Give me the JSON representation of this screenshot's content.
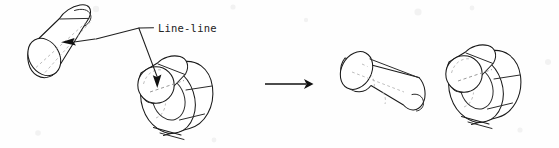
{
  "figure": {
    "kind": "assembly-constraint-diagram",
    "title": "Line-line",
    "background_color": "#fefefe",
    "ink_color": "#1a1a1a",
    "hidden_line_color": "#8f8f8f",
    "width": 559,
    "height": 148
  },
  "annotation": {
    "label": "Line-line",
    "label_x": 158,
    "label_y": 32,
    "leader_vertex_x": 139,
    "leader_vertex_y": 28,
    "leader_dash_end_x": 152,
    "targets": [
      {
        "name": "cylinder-axis",
        "arrow_tip_x": 62,
        "arrow_tip_y": 42,
        "direction": "left"
      },
      {
        "name": "hub-bore-axis",
        "arrow_tip_x": 157,
        "arrow_tip_y": 87,
        "direction": "down"
      }
    ]
  },
  "transform_arrow": {
    "name": "result-arrow",
    "x_start": 265,
    "x_end": 312,
    "y": 84,
    "direction": "right"
  },
  "parts": {
    "left_group": {
      "caption_absent": true,
      "cylinder": {
        "name": "peg-cylinder-before",
        "axis_label": "dashed centerline",
        "end_ellipse_center_x": 44,
        "end_ellipse_center_y": 57
      },
      "hub": {
        "name": "stepped-hub-before",
        "boss_center_x": 156,
        "boss_center_y": 85,
        "boss_radius": 18,
        "ring_count": 2
      }
    },
    "right_group": {
      "cylinder": {
        "name": "peg-cylinder-after",
        "end_ellipse_center_x": 356,
        "end_ellipse_center_y": 70
      },
      "hub": {
        "name": "stepped-hub-after",
        "boss_center_x": 464,
        "boss_center_y": 74,
        "boss_radius": 18,
        "ring_count": 2
      }
    }
  }
}
